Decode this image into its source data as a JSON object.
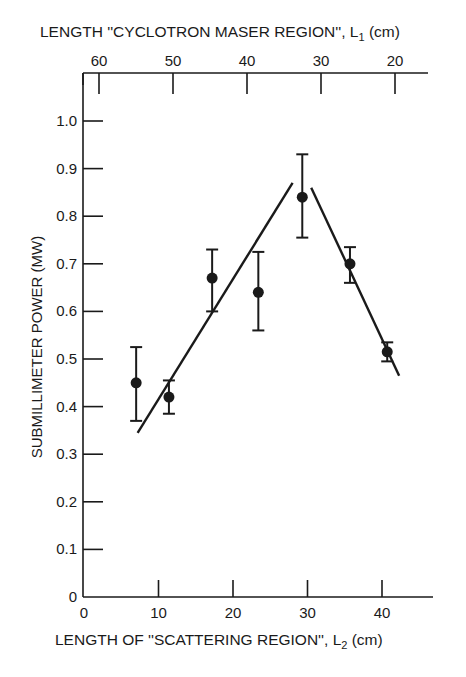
{
  "chart_data": {
    "type": "scatter",
    "title": "",
    "xlabel": "LENGTH OF “SCATTERING REGION”, L2 (cm)",
    "xlabel_parts": {
      "main": "LENGTH OF ''SCATTERING REGION'', L",
      "sub": "2",
      "unit": " (cm)"
    },
    "x2label": "LENGTH “CYCLOTRON MASER REGION”, L1 (cm)",
    "x2label_parts": {
      "main": "LENGTH ''CYCLOTRON MASER REGION'', L",
      "sub": "1",
      "unit": " (cm)"
    },
    "ylabel": "SUBMILLIMETER POWER (MW)",
    "xlim": [
      0,
      46
    ],
    "ylim": [
      0,
      1.05
    ],
    "x_ticks": [
      0,
      10,
      20,
      30,
      40
    ],
    "x_tick_labels": [
      "0",
      "10",
      "20",
      "30",
      "40"
    ],
    "x2_ticks": [
      60,
      50,
      40,
      30,
      20
    ],
    "x2_tick_labels": [
      "60",
      "50",
      "40",
      "30",
      "20"
    ],
    "y_ticks": [
      0,
      0.1,
      0.2,
      0.3,
      0.4,
      0.5,
      0.6,
      0.7,
      0.8,
      0.9,
      1.0
    ],
    "y_tick_labels": [
      "0",
      "0.1",
      "0.2",
      "0.3",
      "0.4",
      "0.5",
      "0.6",
      "0.7",
      "0.8",
      "0.9",
      "1.0"
    ],
    "grid": false,
    "legend": null,
    "series": [
      {
        "name": "Measured power",
        "marker": "filled-circle",
        "x": [
          7.0,
          11.4,
          17.2,
          23.4,
          29.3,
          35.7,
          40.7
        ],
        "y": [
          0.45,
          0.42,
          0.67,
          0.64,
          0.84,
          0.7,
          0.515
        ],
        "y_err_upper": [
          0.525,
          0.455,
          0.73,
          0.725,
          0.93,
          0.735,
          0.535
        ],
        "y_err_lower": [
          0.37,
          0.385,
          0.6,
          0.56,
          0.755,
          0.66,
          0.495
        ]
      }
    ],
    "fit_lines": [
      {
        "name": "rising trend",
        "x": [
          7.2,
          28.0
        ],
        "y": [
          0.345,
          0.87
        ]
      },
      {
        "name": "falling trend",
        "x": [
          30.5,
          42.3
        ],
        "y": [
          0.86,
          0.465
        ]
      }
    ]
  }
}
